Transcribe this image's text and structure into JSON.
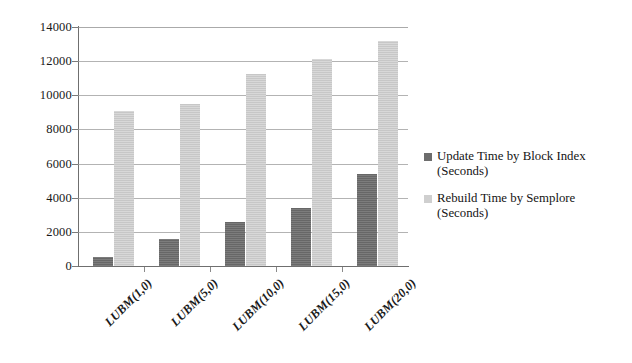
{
  "chart_data": {
    "type": "bar",
    "title": "",
    "subtitle": "",
    "xlabel": "",
    "ylabel": "",
    "categories": [
      "LUBM(1,0)",
      "LUBM(5,0)",
      "LUBM(10,0)",
      "LUBM(15,0)",
      "LUBM(20,0)"
    ],
    "series": [
      {
        "name": "Update Time by Block Index (Seconds)",
        "name_line1": "Update Time by Block Index",
        "name_line2": "(Seconds)",
        "color": "#6d6d6d",
        "values": [
          550,
          1600,
          2600,
          3400,
          5400
        ]
      },
      {
        "name": "Rebuild Time by Semplore (Seconds)",
        "name_line1": "Rebuild Time by Semplore",
        "name_line2": "(Seconds)",
        "color": "#cfcfcf",
        "values": [
          9100,
          9500,
          11250,
          12100,
          13200
        ]
      }
    ],
    "ylim": [
      0,
      14000
    ],
    "ytick_step": 2000,
    "yticks": [
      0,
      2000,
      4000,
      6000,
      8000,
      10000,
      12000,
      14000
    ],
    "ytick_labels": [
      "0",
      "2000",
      "4000",
      "6000",
      "8000",
      "10000",
      "12000",
      "14000"
    ],
    "grid": true,
    "grid_axis": "y",
    "legend_position": "right"
  }
}
